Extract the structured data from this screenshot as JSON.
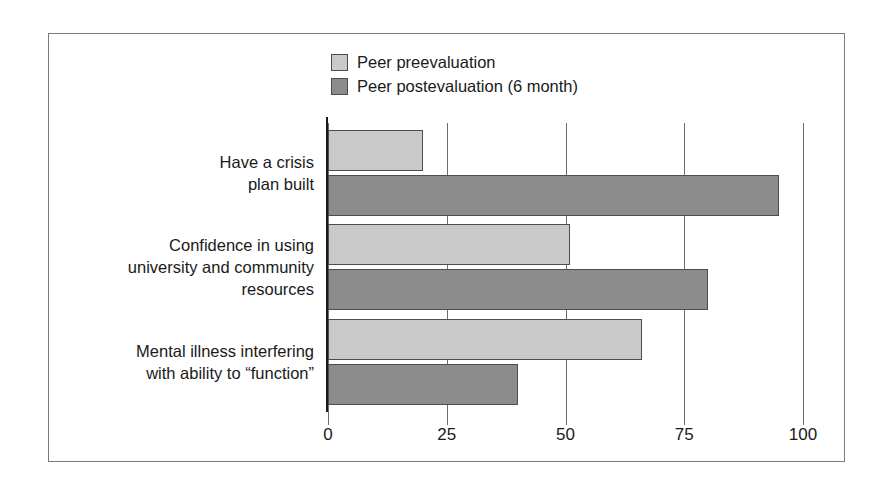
{
  "chart_data": {
    "type": "bar",
    "orientation": "horizontal",
    "title": "",
    "subtitle": "",
    "xlabel": "",
    "ylabel": "",
    "xlim": [
      0,
      100
    ],
    "xticks": [
      "0",
      "25",
      "50",
      "75",
      "100"
    ],
    "xtick_values": [
      0,
      25,
      50,
      75,
      100
    ],
    "grid": true,
    "legend_position": "top-center",
    "categories": [
      "Have a crisis\nplan built",
      "Confidence in using\nuniversity and community\nresources",
      "Mental illness interfering\nwith ability to “function”"
    ],
    "series": [
      {
        "name": "Peer preevaluation",
        "color": "#c9c9c9",
        "values": [
          20,
          51,
          66
        ]
      },
      {
        "name": "Peer postevaluation (6 month)",
        "color": "#8c8c8c",
        "values": [
          95,
          80,
          40
        ]
      }
    ]
  },
  "legend": {
    "items": [
      {
        "label": "Peer preevaluation",
        "color": "#c9c9c9"
      },
      {
        "label": "Peer postevaluation (6 month)",
        "color": "#8c8c8c"
      }
    ]
  },
  "colors": {
    "preevaluation": "#c9c9c9",
    "postevaluation": "#8c8c8c",
    "bar_border": "#4d4d4d",
    "axis": "#1a1a1a",
    "gridline": "#6e6e6e",
    "frame": "#7a7a7a",
    "background": "#ffffff",
    "text": "#1a1a1a"
  }
}
